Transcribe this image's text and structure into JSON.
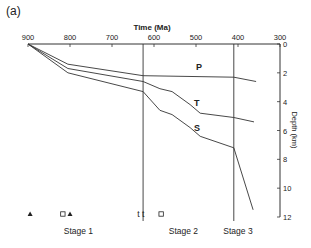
{
  "panel_label": "(a)",
  "chart_data": {
    "type": "line",
    "title": "",
    "xlabel": "Time (Ma)",
    "ylabel": "Depth (km)",
    "x_reversed": true,
    "y_reversed": true,
    "xlim": [
      900,
      300
    ],
    "ylim": [
      0,
      12
    ],
    "x_ticks": [
      900,
      800,
      700,
      600,
      500,
      400,
      300
    ],
    "y_ticks": [
      0,
      2,
      4,
      6,
      8,
      10,
      12
    ],
    "grid": false,
    "series": [
      {
        "name": "P",
        "x": [
          900,
          805,
          626,
          410,
          357
        ],
        "y": [
          0,
          1.4,
          2.2,
          2.3,
          2.6
        ]
      },
      {
        "name": "T",
        "x": [
          900,
          805,
          626,
          586,
          557,
          514,
          490,
          410,
          362
        ],
        "y": [
          0,
          1.7,
          2.6,
          3.1,
          3.3,
          4.2,
          4.8,
          5.1,
          5.4
        ]
      },
      {
        "name": "S",
        "x": [
          900,
          805,
          626,
          586,
          557,
          514,
          490,
          410,
          364
        ],
        "y": [
          0,
          2.0,
          3.3,
          4.6,
          4.9,
          5.8,
          6.4,
          7.2,
          11.5
        ]
      }
    ],
    "vertical_lines": [
      626,
      410
    ],
    "stages": [
      {
        "label": "Stage 1",
        "from": 900,
        "to": 626
      },
      {
        "label": "Stage 2",
        "from": 626,
        "to": 410
      },
      {
        "label": "Stage 3",
        "from": 410,
        "to": 300
      }
    ],
    "markers": [
      {
        "symbol": "filled-triangle",
        "x": 895
      },
      {
        "symbol": "open-square",
        "x": 817
      },
      {
        "symbol": "filled-triangle",
        "x": 800
      },
      {
        "symbol": "t",
        "x": 637
      },
      {
        "symbol": "t",
        "x": 626
      },
      {
        "symbol": "open-square",
        "x": 583
      }
    ]
  }
}
